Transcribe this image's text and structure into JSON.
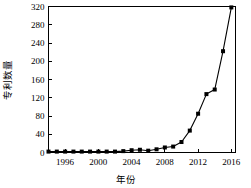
{
  "chart_data": {
    "type": "line",
    "title": "",
    "xlabel": "年份",
    "ylabel": "专利数量",
    "xlim": [
      1994,
      2016.5
    ],
    "ylim": [
      0,
      320
    ],
    "xticks": [
      1996,
      2000,
      2004,
      2008,
      2012,
      2016
    ],
    "yticks": [
      0,
      40,
      80,
      120,
      160,
      200,
      240,
      280,
      320
    ],
    "grid": false,
    "legend": null,
    "marker": "square",
    "series": [
      {
        "name": "专利数量",
        "x": [
          1994,
          1995,
          1996,
          1997,
          1998,
          1999,
          2000,
          2001,
          2002,
          2003,
          2004,
          2005,
          2006,
          2007,
          2008,
          2009,
          2010,
          2011,
          2012,
          2013,
          2014,
          2015,
          2016
        ],
        "values": [
          2,
          2,
          2,
          2,
          2,
          2,
          2,
          2,
          2,
          3,
          5,
          6,
          4,
          7,
          11,
          13,
          23,
          48,
          85,
          128,
          138,
          222,
          318
        ]
      }
    ]
  },
  "axis": {
    "y_tick_labels": [
      "0",
      "40",
      "80",
      "120",
      "160",
      "200",
      "240",
      "280",
      "320"
    ],
    "x_tick_labels": [
      "1996",
      "2000",
      "2004",
      "2008",
      "2012",
      "2016"
    ],
    "x_title": "年份",
    "y_title": "专利数量"
  }
}
